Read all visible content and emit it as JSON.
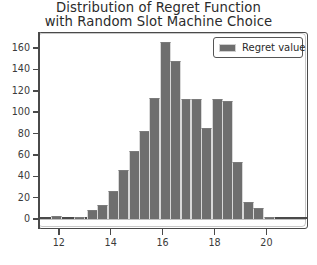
{
  "chart_data": {
    "type": "bar",
    "title": "Distribution of Regret Function with Random Slot Machine Choice",
    "title_lines": [
      "Distribution of Regret Function",
      "with Random Slot Machine Choice"
    ],
    "xlabel": "",
    "ylabel": "",
    "xlim": [
      11.2,
      21.6
    ],
    "ylim": [
      0,
      175
    ],
    "grid": false,
    "legend_position": "upper right",
    "bar_color": "#6e6e6e",
    "bar_edge_color": "#d8d8d8",
    "axis_color": "#4a4a4a",
    "background_color": "#ffffff",
    "bar_width": 0.42,
    "legend": [
      {
        "label": "Regret value",
        "color": "#6e6e6e"
      }
    ],
    "series": [
      {
        "name": "Regret value",
        "x": [
          11.9,
          12.8,
          13.3,
          13.7,
          14.1,
          14.5,
          14.9,
          15.3,
          15.7,
          16.1,
          16.5,
          16.9,
          17.3,
          17.7,
          18.1,
          18.5,
          18.9,
          19.3,
          19.7,
          20.1
        ],
        "values": [
          3,
          2,
          8,
          13,
          26,
          46,
          64,
          82,
          113,
          166,
          148,
          112,
          112,
          85,
          112,
          110,
          53,
          16,
          10,
          2
        ]
      }
    ],
    "yticks": [
      0,
      20,
      40,
      60,
      80,
      100,
      120,
      140,
      160
    ],
    "ytick_labels": [
      "0",
      "20",
      "40",
      "60",
      "80",
      "100",
      "120",
      "140",
      "160"
    ],
    "xticks": [
      12,
      14,
      16,
      18,
      20
    ],
    "xtick_labels": [
      "12",
      "14",
      "16",
      "18",
      "20"
    ]
  }
}
